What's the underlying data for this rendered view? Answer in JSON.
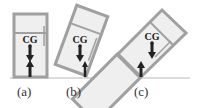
{
  "figure": {
    "panels": [
      {
        "id": "a",
        "label": "(a)",
        "cg_label": "CG",
        "tilt_deg": 0
      },
      {
        "id": "b",
        "label": "(b)",
        "cg_label": "CG",
        "tilt_deg": -20
      },
      {
        "id": "c",
        "label": "(c)",
        "cg_label": "CG",
        "tilt_deg": -45
      }
    ],
    "colors": {
      "frame": "#a0a0a0",
      "fill": "#efefef",
      "arrow": "#222222",
      "ground": "#b8b8b8"
    }
  }
}
